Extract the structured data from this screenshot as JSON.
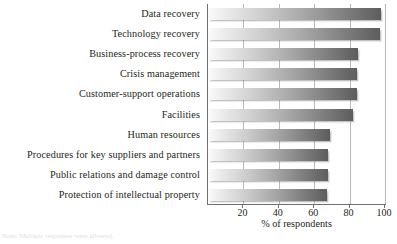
{
  "chart_data": {
    "type": "bar",
    "orientation": "horizontal",
    "title": "",
    "subtitle": "",
    "xlabel": "% of respondents",
    "ylabel": "",
    "xlim": [
      0,
      100
    ],
    "xticks": [
      20,
      40,
      60,
      80,
      100
    ],
    "xticklabels": [
      "20",
      "40",
      "60",
      "80",
      "100"
    ],
    "grid": "vertical",
    "legend": "none",
    "categories": [
      "Data recovery",
      "Technology recovery",
      "Business-process recovery",
      "Crisis management",
      "Customer-support operations",
      "Facilities",
      "Human resources",
      "Procedures for key suppliers and partners",
      "Public relations and damage control",
      "Protection of intellectual property"
    ],
    "values": [
      98,
      97,
      85,
      84,
      84,
      82,
      69,
      68,
      68,
      67
    ],
    "bar_gradient_from": "#fbfbfb",
    "bar_gradient_to": "#5d5d5d",
    "axis_color": "#6f6f6f",
    "gridline_color": "#b9b9b9",
    "text_color": "#231f20"
  },
  "footnote": {
    "text": "Note: Multiple responses were allowed."
  }
}
